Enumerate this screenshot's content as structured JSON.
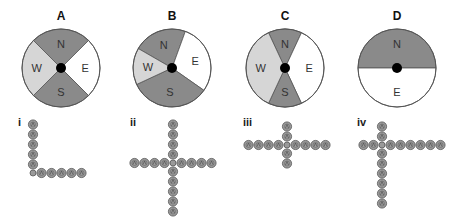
{
  "colors": {
    "dark": "#8a8a8a",
    "light": "#d6d6d6",
    "white": "#ffffff",
    "outline": "#555555",
    "hub": "#000000",
    "bead": "#9a9a9a",
    "bead_stroke": "#555555"
  },
  "panels": [
    {
      "label": "A",
      "cx": 61,
      "cy": 68,
      "r": 39,
      "sectors": [
        {
          "dir": "N",
          "start": -45,
          "end": 45,
          "fill": "dark"
        },
        {
          "dir": "E",
          "start": 45,
          "end": 135,
          "fill": "white"
        },
        {
          "dir": "S",
          "start": 135,
          "end": 225,
          "fill": "dark"
        },
        {
          "dir": "W",
          "start": 225,
          "end": 315,
          "fill": "light"
        }
      ]
    },
    {
      "label": "B",
      "cx": 172,
      "cy": 68,
      "r": 39,
      "sectors": [
        {
          "dir": "N",
          "start": -60,
          "end": 20,
          "fill": "dark"
        },
        {
          "dir": "E",
          "start": 20,
          "end": 125,
          "fill": "white"
        },
        {
          "dir": "S",
          "start": 125,
          "end": 245,
          "fill": "dark"
        },
        {
          "dir": "W",
          "start": 245,
          "end": 300,
          "fill": "light"
        }
      ]
    },
    {
      "label": "C",
      "cx": 285,
      "cy": 68,
      "r": 39,
      "sectors": [
        {
          "dir": "N",
          "start": -25,
          "end": 25,
          "fill": "dark"
        },
        {
          "dir": "E",
          "start": 25,
          "end": 155,
          "fill": "white"
        },
        {
          "dir": "S",
          "start": 155,
          "end": 205,
          "fill": "dark"
        },
        {
          "dir": "W",
          "start": 205,
          "end": 335,
          "fill": "light"
        }
      ]
    },
    {
      "label": "D",
      "cx": 397,
      "cy": 68,
      "r": 39,
      "sectors": [
        {
          "dir": "N",
          "start": -90,
          "end": 90,
          "fill": "dark"
        },
        {
          "dir": "E",
          "start": 90,
          "end": 270,
          "fill": "white"
        }
      ]
    }
  ],
  "patterns": [
    {
      "label": "i",
      "label_x": 18,
      "label_y": 126,
      "cx": 33,
      "cy": 173,
      "up": 5,
      "down": 0,
      "left": 0,
      "right": 5
    },
    {
      "label": "ii",
      "label_x": 130,
      "label_y": 126,
      "cx": 173,
      "cy": 163,
      "up": 4,
      "down": 5,
      "left": 4,
      "right": 4
    },
    {
      "label": "iii",
      "label_x": 243,
      "label_y": 126,
      "cx": 287,
      "cy": 145,
      "up": 2,
      "down": 2,
      "left": 4,
      "right": 4
    },
    {
      "label": "iv",
      "label_x": 357,
      "label_y": 126,
      "cx": 382,
      "cy": 145,
      "up": 2,
      "down": 6,
      "left": 2,
      "right": 6
    }
  ],
  "bead": {
    "spacing": 10,
    "radius": 4.6,
    "center_radius": 3
  }
}
